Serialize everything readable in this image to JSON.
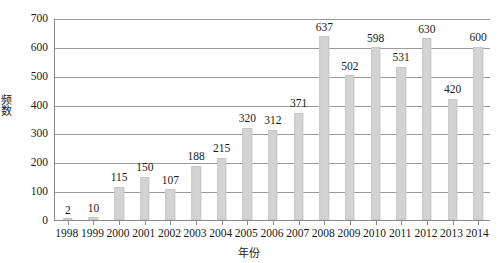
{
  "chart_data": {
    "type": "bar",
    "title": "",
    "xlabel": "年份",
    "ylabel": "频数",
    "categories": [
      "1998",
      "1999",
      "2000",
      "2001",
      "2002",
      "2003",
      "2004",
      "2005",
      "2006",
      "2007",
      "2008",
      "2009",
      "2010",
      "2011",
      "2012",
      "2013",
      "2014"
    ],
    "values": [
      2,
      10,
      115,
      150,
      107,
      188,
      215,
      320,
      312,
      371,
      637,
      502,
      598,
      531,
      630,
      420,
      600
    ],
    "ylim": [
      0,
      700
    ],
    "yticks": [
      0,
      100,
      200,
      300,
      400,
      500,
      600,
      700
    ],
    "ytick_labels": [
      "0",
      "100",
      "200",
      "300",
      "400",
      "500",
      "600",
      "700"
    ],
    "grid": true,
    "legend": "none",
    "show_data_labels": true,
    "bar_color": "#d3d3d3",
    "axis_color": "#8a8a8a",
    "grid_color": "#9a9a9a",
    "text_color": "#1a1a1a",
    "background": "#ffffff"
  }
}
